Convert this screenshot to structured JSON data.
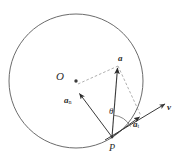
{
  "figure": {
    "type": "physics-vector-diagram",
    "background_color": "#ffffff",
    "stroke_color": "#2b2b2b",
    "dashed_color": "#8a8a8a",
    "labels": {
      "center": "O",
      "point_on_circle": "P",
      "acceleration": "a",
      "normal_component": "a",
      "normal_subscript": "n",
      "tangential_component": "a",
      "tangential_subscript": "t",
      "velocity": "v",
      "angle": "θ"
    }
  },
  "geometry": {
    "circle": {
      "cx": 76,
      "cy": 81,
      "r": 67
    },
    "points": {
      "O": {
        "x": 76,
        "y": 81
      },
      "P": {
        "x": 112,
        "y": 137
      },
      "a_tip": {
        "x": 118,
        "y": 66
      },
      "an_tip": {
        "x": 79,
        "y": 93
      },
      "at_tip": {
        "x": 141,
        "y": 116
      },
      "v_tip": {
        "x": 166,
        "y": 104
      }
    },
    "angle_theta_degrees": 43
  },
  "label_positions": {
    "O": {
      "x": 57,
      "y": 72
    },
    "P": {
      "x": 110,
      "y": 144
    },
    "a": {
      "x": 118,
      "y": 56
    },
    "an": {
      "x": 66,
      "y": 98
    },
    "at": {
      "x": 135,
      "y": 121
    },
    "v": {
      "x": 167,
      "y": 105
    },
    "theta": {
      "x": 110,
      "y": 109
    }
  }
}
